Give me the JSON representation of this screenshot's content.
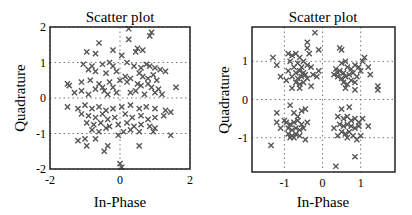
{
  "chart_data": [
    {
      "type": "scatter",
      "title": "Scatter plot",
      "xlabel": "In-Phase",
      "ylabel": "Quadrature",
      "xlim": [
        -2,
        2
      ],
      "ylim": [
        -2,
        2
      ],
      "xticks": [
        -2,
        0,
        2
      ],
      "yticks": [
        -2,
        -1,
        0,
        1,
        2
      ],
      "grid": true,
      "marker": "x",
      "color": "#555555",
      "description": "Noisy QPSK constellation, widely dispersed points centred around the origin with no clear clustering",
      "points": [
        [
          0.25,
          1.95
        ],
        [
          0.9,
          1.85
        ],
        [
          0.85,
          1.75
        ],
        [
          0.25,
          1.65
        ],
        [
          -0.6,
          1.55
        ],
        [
          0.5,
          1.4
        ],
        [
          0.45,
          1.3
        ],
        [
          0.65,
          1.35
        ],
        [
          -0.95,
          1.3
        ],
        [
          -0.2,
          1.35
        ],
        [
          -0.7,
          1.25
        ],
        [
          0.05,
          1.2
        ],
        [
          -1.05,
          0.95
        ],
        [
          -0.8,
          0.9
        ],
        [
          -0.5,
          0.95
        ],
        [
          -0.3,
          1.0
        ],
        [
          -0.2,
          0.9
        ],
        [
          0.2,
          1.0
        ],
        [
          0.4,
          0.9
        ],
        [
          0.6,
          0.85
        ],
        [
          0.75,
          0.95
        ],
        [
          0.85,
          0.9
        ],
        [
          1.0,
          0.85
        ],
        [
          1.15,
          0.8
        ],
        [
          1.3,
          0.75
        ],
        [
          -0.9,
          0.8
        ],
        [
          -0.7,
          0.75
        ],
        [
          -0.4,
          0.7
        ],
        [
          -0.1,
          0.75
        ],
        [
          0.15,
          0.6
        ],
        [
          0.3,
          0.55
        ],
        [
          0.55,
          0.7
        ],
        [
          0.65,
          0.6
        ],
        [
          0.8,
          0.55
        ],
        [
          0.95,
          0.65
        ],
        [
          1.05,
          0.5
        ],
        [
          -1.5,
          0.4
        ],
        [
          -1.45,
          0.35
        ],
        [
          -1.1,
          0.45
        ],
        [
          -0.85,
          0.5
        ],
        [
          -0.6,
          0.4
        ],
        [
          -0.5,
          0.3
        ],
        [
          -0.3,
          0.45
        ],
        [
          -0.2,
          0.3
        ],
        [
          0.0,
          0.5
        ],
        [
          0.2,
          0.45
        ],
        [
          0.5,
          0.4
        ],
        [
          0.6,
          0.35
        ],
        [
          0.8,
          0.4
        ],
        [
          0.9,
          0.3
        ],
        [
          1.1,
          0.25
        ],
        [
          1.6,
          0.3
        ],
        [
          -1.3,
          0.15
        ],
        [
          -1.1,
          0.2
        ],
        [
          -0.9,
          0.1
        ],
        [
          -0.7,
          0.25
        ],
        [
          -0.45,
          0.2
        ],
        [
          -0.35,
          0.1
        ],
        [
          -0.1,
          0.15
        ],
        [
          0.3,
          0.15
        ],
        [
          0.45,
          0.2
        ],
        [
          0.7,
          0.1
        ],
        [
          1.0,
          0.15
        ],
        [
          1.2,
          0.1
        ],
        [
          -1.5,
          -0.25
        ],
        [
          -1.2,
          -0.3
        ],
        [
          -1.0,
          -0.2
        ],
        [
          -0.8,
          -0.3
        ],
        [
          -0.6,
          -0.25
        ],
        [
          -0.4,
          -0.35
        ],
        [
          -0.2,
          -0.3
        ],
        [
          0.05,
          -0.25
        ],
        [
          0.3,
          -0.2
        ],
        [
          0.55,
          -0.3
        ],
        [
          0.75,
          -0.25
        ],
        [
          1.0,
          -0.3
        ],
        [
          1.3,
          -0.35
        ],
        [
          1.45,
          -0.4
        ],
        [
          -1.1,
          -0.45
        ],
        [
          -0.9,
          -0.5
        ],
        [
          -0.7,
          -0.55
        ],
        [
          -0.5,
          -0.45
        ],
        [
          -0.35,
          -0.6
        ],
        [
          -0.15,
          -0.55
        ],
        [
          0.15,
          -0.45
        ],
        [
          0.35,
          -0.55
        ],
        [
          0.6,
          -0.5
        ],
        [
          0.8,
          -0.6
        ],
        [
          1.0,
          -0.55
        ],
        [
          1.25,
          -0.5
        ],
        [
          -0.95,
          -0.7
        ],
        [
          -0.75,
          -0.75
        ],
        [
          -0.55,
          -0.7
        ],
        [
          -0.3,
          -0.8
        ],
        [
          -0.05,
          -0.75
        ],
        [
          0.2,
          -0.7
        ],
        [
          0.4,
          -0.8
        ],
        [
          0.6,
          -0.75
        ],
        [
          0.85,
          -0.8
        ],
        [
          1.0,
          -0.85
        ],
        [
          -0.8,
          -0.9
        ],
        [
          -0.6,
          -0.95
        ],
        [
          -0.4,
          -0.85
        ],
        [
          0.1,
          -0.95
        ],
        [
          0.3,
          -0.9
        ],
        [
          0.55,
          -0.95
        ],
        [
          0.95,
          -0.95
        ],
        [
          1.45,
          -1.05
        ],
        [
          -0.05,
          -1.05
        ],
        [
          -1.2,
          -1.2
        ],
        [
          -1.0,
          -1.15
        ],
        [
          -0.95,
          -1.35
        ],
        [
          -0.7,
          -1.15
        ],
        [
          -0.35,
          -1.35
        ],
        [
          -0.45,
          -1.5
        ],
        [
          0.55,
          -1.35
        ],
        [
          0.0,
          -1.85
        ],
        [
          0.05,
          -1.95
        ]
      ]
    },
    {
      "type": "scatter",
      "title": "Scatter plot",
      "xlabel": "In-Phase",
      "ylabel": "Quadrature",
      "xlim": [
        -1.85,
        1.9
      ],
      "ylim": [
        -1.9,
        1.9
      ],
      "xticks": [
        -1,
        0,
        1
      ],
      "yticks": [
        -1,
        0,
        1
      ],
      "grid": true,
      "marker": "x",
      "color": "#555555",
      "description": "QPSK constellation with four distinct clusters near (±0.7, ±0.7)",
      "points": [
        [
          -0.2,
          1.75
        ],
        [
          -0.4,
          1.5
        ],
        [
          -0.4,
          1.35
        ],
        [
          -0.1,
          1.3
        ],
        [
          -0.35,
          1.2
        ],
        [
          0.45,
          1.35
        ],
        [
          0.5,
          1.3
        ],
        [
          -1.3,
          1.1
        ],
        [
          -1.2,
          0.9
        ],
        [
          -0.9,
          1.2
        ],
        [
          -0.8,
          1.15
        ],
        [
          -0.7,
          1.2
        ],
        [
          -0.6,
          1.1
        ],
        [
          -0.85,
          1.0
        ],
        [
          -0.65,
          0.95
        ],
        [
          -0.5,
          1.0
        ],
        [
          -0.75,
          0.85
        ],
        [
          -0.55,
          0.85
        ],
        [
          -0.4,
          0.9
        ],
        [
          -0.3,
          0.85
        ],
        [
          -0.9,
          0.75
        ],
        [
          -0.7,
          0.7
        ],
        [
          -0.6,
          0.75
        ],
        [
          -0.5,
          0.7
        ],
        [
          -0.45,
          0.65
        ],
        [
          -0.8,
          0.6
        ],
        [
          -0.65,
          0.55
        ],
        [
          -0.55,
          0.6
        ],
        [
          -0.4,
          0.55
        ],
        [
          -0.25,
          0.65
        ],
        [
          -0.15,
          0.6
        ],
        [
          -1.1,
          0.6
        ],
        [
          -0.95,
          0.5
        ],
        [
          -0.7,
          0.45
        ],
        [
          -0.6,
          0.4
        ],
        [
          -0.5,
          0.45
        ],
        [
          -0.8,
          0.3
        ],
        [
          -0.6,
          0.3
        ],
        [
          -0.3,
          0.35
        ],
        [
          -0.1,
          0.75
        ],
        [
          0.35,
          0.8
        ],
        [
          0.45,
          0.75
        ],
        [
          0.55,
          0.7
        ],
        [
          0.65,
          0.85
        ],
        [
          0.75,
          0.8
        ],
        [
          0.85,
          0.9
        ],
        [
          0.95,
          0.85
        ],
        [
          1.05,
          1.0
        ],
        [
          1.1,
          1.1
        ],
        [
          0.6,
          1.0
        ],
        [
          0.5,
          0.95
        ],
        [
          0.4,
          0.6
        ],
        [
          0.5,
          0.55
        ],
        [
          0.6,
          0.6
        ],
        [
          0.7,
          0.65
        ],
        [
          0.8,
          0.7
        ],
        [
          0.9,
          0.6
        ],
        [
          1.0,
          0.75
        ],
        [
          1.2,
          0.85
        ],
        [
          0.55,
          0.45
        ],
        [
          0.65,
          0.4
        ],
        [
          0.75,
          0.5
        ],
        [
          0.85,
          0.45
        ],
        [
          0.4,
          0.7
        ],
        [
          0.3,
          0.65
        ],
        [
          1.25,
          0.65
        ],
        [
          0.85,
          0.25
        ],
        [
          0.6,
          0.3
        ],
        [
          1.45,
          0.35
        ],
        [
          1.45,
          0.25
        ],
        [
          -0.85,
          -0.15
        ],
        [
          -1.2,
          -0.35
        ],
        [
          -0.55,
          -0.3
        ],
        [
          -0.45,
          -0.25
        ],
        [
          -1.2,
          -0.6
        ],
        [
          -1.1,
          -0.75
        ],
        [
          -1.0,
          -0.55
        ],
        [
          -0.95,
          -0.6
        ],
        [
          -0.85,
          -0.65
        ],
        [
          -0.75,
          -0.6
        ],
        [
          -0.65,
          -0.55
        ],
        [
          -0.55,
          -0.65
        ],
        [
          -0.9,
          -0.75
        ],
        [
          -0.8,
          -0.8
        ],
        [
          -0.7,
          -0.75
        ],
        [
          -0.6,
          -0.8
        ],
        [
          -0.5,
          -0.75
        ],
        [
          -0.9,
          -0.9
        ],
        [
          -0.8,
          -0.95
        ],
        [
          -0.7,
          -0.9
        ],
        [
          -0.6,
          -0.95
        ],
        [
          -0.75,
          -1.0
        ],
        [
          -0.85,
          -1.0
        ],
        [
          -0.65,
          -0.45
        ],
        [
          -0.75,
          -0.35
        ],
        [
          -0.45,
          -1.05
        ],
        [
          -0.4,
          -0.6
        ],
        [
          -1.35,
          -1.2
        ],
        [
          0.5,
          -0.25
        ],
        [
          0.7,
          -0.2
        ],
        [
          0.4,
          -0.45
        ],
        [
          0.55,
          -0.5
        ],
        [
          0.65,
          -0.45
        ],
        [
          0.75,
          -0.55
        ],
        [
          0.85,
          -0.5
        ],
        [
          0.95,
          -0.6
        ],
        [
          1.05,
          -0.5
        ],
        [
          0.45,
          -0.65
        ],
        [
          0.55,
          -0.7
        ],
        [
          0.65,
          -0.65
        ],
        [
          0.75,
          -0.7
        ],
        [
          0.85,
          -0.75
        ],
        [
          0.95,
          -0.7
        ],
        [
          1.2,
          -0.7
        ],
        [
          0.5,
          -0.85
        ],
        [
          0.6,
          -0.9
        ],
        [
          0.7,
          -0.85
        ],
        [
          0.8,
          -0.95
        ],
        [
          0.4,
          -0.95
        ],
        [
          0.65,
          -1.0
        ],
        [
          0.9,
          -1.05
        ],
        [
          0.3,
          -0.75
        ],
        [
          1.0,
          -0.95
        ],
        [
          0.85,
          -1.5
        ],
        [
          0.35,
          -1.75
        ]
      ]
    }
  ]
}
